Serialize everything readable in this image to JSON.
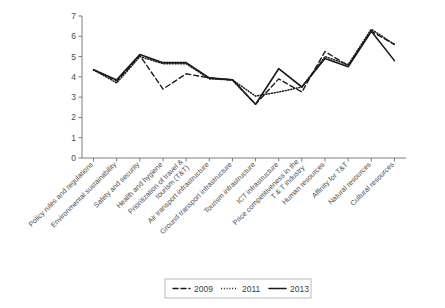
{
  "chart_data": {
    "type": "line",
    "title": "",
    "xlabel": "",
    "ylabel": "",
    "ylim": [
      0,
      7
    ],
    "yticks": [
      0,
      1,
      2,
      3,
      4,
      5,
      6,
      7
    ],
    "grid": false,
    "legend_position": "bottom",
    "categories": [
      "Policy rules and regulations",
      "Environmental sustainability",
      "Safety and security",
      "Health and hygiene",
      "Prioritization of travel & tourism (T&T)",
      "Air transport infrastructure",
      "Ground transport infrastructure",
      "Tourism infrastructure",
      "ICT infrastructure",
      "Price competitiveness in the T & T industry",
      "Human resources",
      "Affinity for T&T",
      "Natural resources",
      "Cultural resources"
    ],
    "series": [
      {
        "name": "2009",
        "style": "dashed",
        "color": "#1a1a1a",
        "values": [
          4.35,
          3.8,
          5.05,
          3.4,
          4.15,
          3.95,
          3.85,
          2.65,
          3.9,
          3.25,
          5.25,
          4.55,
          6.25,
          5.6
        ]
      },
      {
        "name": "2011",
        "style": "dotted",
        "color": "#1a1a1a",
        "values": [
          4.35,
          3.7,
          5.0,
          4.65,
          4.65,
          3.9,
          3.85,
          3.05,
          3.25,
          3.5,
          5.0,
          4.6,
          6.35,
          5.6
        ]
      },
      {
        "name": "2013",
        "style": "solid",
        "color": "#1a1a1a",
        "values": [
          4.35,
          3.85,
          5.1,
          4.7,
          4.7,
          3.95,
          3.85,
          2.65,
          4.4,
          3.5,
          4.9,
          4.5,
          6.25,
          4.8
        ]
      }
    ]
  },
  "legend": {
    "entries": [
      {
        "label": "2009",
        "style": "dashed"
      },
      {
        "label": "2011",
        "style": "dotted"
      },
      {
        "label": "2013",
        "style": "solid"
      }
    ]
  }
}
